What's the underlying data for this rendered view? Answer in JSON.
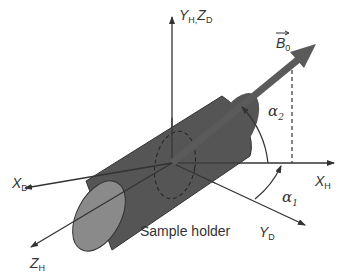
{
  "diagram": {
    "type": "coordinate-frame-schematic",
    "labels": {
      "y_h": "Y",
      "y_h_sub": "H,",
      "z_d": "Z",
      "z_d_sub": "D",
      "b0": "B",
      "b0_sub": "0",
      "x_h": "X",
      "x_h_sub": "H",
      "x_d": "X",
      "x_d_sub": "D",
      "z_h": "Z",
      "z_h_sub": "H",
      "y_d": "Y",
      "y_d_sub": "D",
      "alpha1": "α",
      "alpha1_sub": "1",
      "alpha2": "α",
      "alpha2_sub": "2",
      "sample_holder": "Sample holder"
    },
    "colors": {
      "axis": "#333333",
      "cylinder_body": "#555555",
      "cylinder_end": "#8a8a8a",
      "b0_arrow": "#5a5a5a",
      "text": "#333333"
    }
  }
}
